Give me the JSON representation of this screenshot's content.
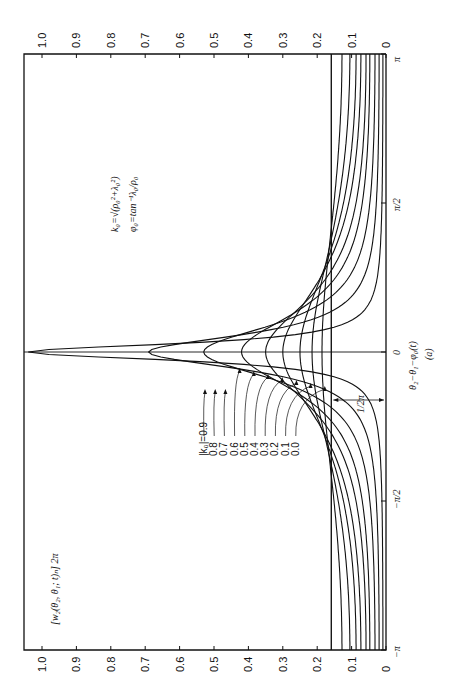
{
  "chart_data": {
    "type": "line",
    "orientation": "rotated-90-ccw",
    "title": "",
    "ylabel": "[w2(θ2, θ1; t)_N] 2π",
    "xlabel": "θ2 − θ1 − φ0(t)",
    "caption": "(a)",
    "x_ticks": [
      "−π",
      "−π/2",
      "0",
      "π/2",
      "π"
    ],
    "xlim": [
      -3.14159,
      3.14159
    ],
    "y_ticks": [
      "0",
      "0.1",
      "0.2",
      "0.3",
      "0.4",
      "0.5",
      "0.6",
      "0.7",
      "0.8",
      "0.9",
      "1.0"
    ],
    "ylim": [
      0,
      1.05
    ],
    "grid": false,
    "legend_title": "|k0| =",
    "series": [
      {
        "name": "0.9",
        "peak": 1.04,
        "min_at_pi": 0.009
      },
      {
        "name": "0.8",
        "peak": 0.69,
        "min_at_pi": 0.02
      },
      {
        "name": "0.7",
        "peak": 0.53,
        "min_at_pi": 0.032
      },
      {
        "name": "0.6",
        "peak": 0.42,
        "min_at_pi": 0.047
      },
      {
        "name": "0.5",
        "peak": 0.35,
        "min_at_pi": 0.058
      },
      {
        "name": "0.4",
        "peak": 0.3,
        "min_at_pi": 0.073
      },
      {
        "name": "0.3",
        "peak": 0.25,
        "min_at_pi": 0.087
      },
      {
        "name": "0.2",
        "peak": 0.215,
        "min_at_pi": 0.105
      },
      {
        "name": "0.1",
        "peak": 0.186,
        "min_at_pi": 0.128
      },
      {
        "name": "0.0",
        "peak": 0.159,
        "min_at_pi": 0.159
      }
    ],
    "annotations": [
      {
        "text": "1/2π",
        "meaning": "constant level of the |k0|=0.0 curve"
      },
      {
        "text": "k0 = √(ρ0² + λ0²)"
      },
      {
        "text": "φ0 = tan⁻¹ λ0/ρ0"
      }
    ]
  },
  "labels": {
    "ylabel": "[w₂(θ₂, θ₁; t)ₙ] 2π",
    "xlabel": "θ₂−θ₁−φ₀(t)",
    "caption": "(a)",
    "half_pi_marker": "1/2π",
    "formula1": "k₀=√(ρ₀²+λ₀²)",
    "formula2": "φ₀=tan⁻¹λ₀/ρ₀",
    "legend_prefix": "|k₀|=",
    "x_tick_labels": [
      "−π",
      "−π/2",
      "0",
      "π/2",
      "π"
    ]
  }
}
